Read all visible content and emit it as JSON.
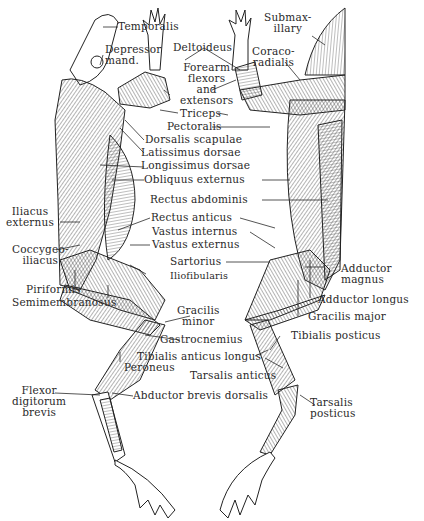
{
  "diagram": {
    "labels": {
      "temporalis": "Temporalis",
      "depressor_mand": "Depressor\nmand.",
      "deltoideus": "Deltoideus",
      "submaxillary": "Submax-\nillary",
      "coracoradialis": "Coraco-\nradialis",
      "forearm": "Forearm\nflexors\nand\nextensors",
      "triceps": "Triceps",
      "pectoralis": "Pectoralis",
      "dorsalis_scapulae": "Dorsalis scapulae",
      "latissimus_dorsae": "Latissimus dorsae",
      "longissimus_dorsae": "Longissimus dorsae",
      "obliquus_externus": "Obliquus externus",
      "rectus_abdominis": "Rectus abdominis",
      "iliacus_externus": "Iliacus\nexternus",
      "rectus_anticus": "Rectus anticus",
      "vastus_internus": "Vastus internus",
      "vastus_externus": "Vastus externus",
      "coccygeo_iliacus": "Coccygeo-\niliacus",
      "sartorius": "Sartorius",
      "iliofibularis": "Iliofibularis",
      "adductor_magnus": "Adductor\nmagnus",
      "piriformis": "Piriformis",
      "semimembranosus": "Semimembranosus",
      "adductor_longus": "Adductor longus",
      "gracilis_minor": "Gracilis\nminor",
      "gracilis_major": "Gracilis major",
      "gastrocnemius": "Gastrocnemius",
      "tibialis_posticus": "Tibialis posticus",
      "tibialis_anticus_longus": "Tibialis anticus longus",
      "peroneus": "Peroneus",
      "tarsalis_anticus": "Tarsalis anticus",
      "flexor_digitorum_brevis": "Flexor\ndigitorum\nbrevis",
      "abductor_brevis_dorsalis": "Abductor brevis dorsalis",
      "tarsalis_posticus": "Tarsalis\nposticus"
    },
    "colors": {
      "ink": "#2a2a2a",
      "muscle_fill": "#e6e6e6",
      "muscle_dark": "#9a9a9a",
      "background": "#ffffff"
    }
  }
}
